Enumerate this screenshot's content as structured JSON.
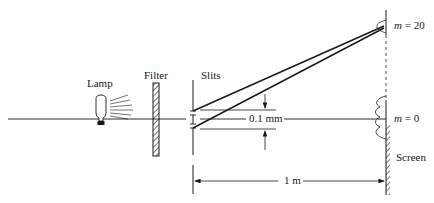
{
  "diagram": {
    "type": "double-slit interference setup",
    "labels": {
      "lamp": "Lamp",
      "filter": "Filter",
      "slits": "Slits",
      "slit_separation": "0.1 mm",
      "distance": "1 m",
      "screen": "Screen",
      "order_top_var": "m",
      "order_top_val": "= 20",
      "order_center_var": "m",
      "order_center_val": "= 0"
    },
    "colors": {
      "ink": "#1a1a1a",
      "background": "#ffffff"
    }
  }
}
